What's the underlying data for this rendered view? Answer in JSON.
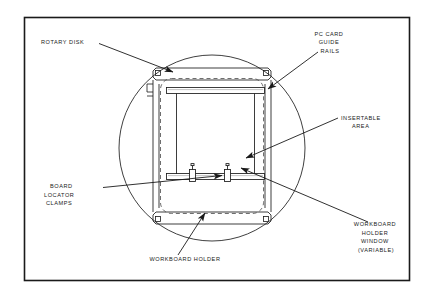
{
  "figure": {
    "type": "technical-line-diagram",
    "background_color": "#ffffff",
    "line_color": "#1a1a1a",
    "frame": {
      "x": 24,
      "y": 17,
      "width": 385,
      "height": 263
    }
  },
  "labels": {
    "rotary_disk": {
      "lines": [
        "ROTARY DISK"
      ],
      "align": "start",
      "x": 41,
      "y": 44
    },
    "pc_card_guide_rails": {
      "lines": [
        "PC CARD",
        "GUIDE",
        "RAILS"
      ],
      "align": "middle",
      "x": 330,
      "y": 36
    },
    "insertable_area": {
      "lines": [
        "INSERTABLE",
        "AREA"
      ],
      "align": "start",
      "x": 341,
      "y": 120
    },
    "board_locator_clamps": {
      "lines": [
        "BOARD",
        "LOCATOR",
        "CLAMPS"
      ],
      "align": "start",
      "x": 44,
      "y": 188
    },
    "workboard_holder": {
      "lines": [
        "WORKBOARD HOLDER"
      ],
      "align": "middle",
      "x": 185,
      "y": 261
    },
    "workboard_holder_window": {
      "lines": [
        "WORKBOARD",
        "HOLDER",
        "WINDOW",
        "(VARIABLE)"
      ],
      "align": "middle",
      "x": 376,
      "y": 226
    }
  },
  "parts": {
    "rotary_disk": {
      "shape": "circle",
      "cx": 212,
      "cy": 148,
      "r": 93
    },
    "holder_frame": {
      "shape": "rect",
      "x": 152,
      "y": 70,
      "width": 120,
      "height": 152
    },
    "holder_window": {
      "shape": "rounded-dashed-rect",
      "x": 158,
      "y": 76,
      "width": 108,
      "height": 140,
      "radius": 12
    },
    "top_guide_rail": {
      "shape": "bar",
      "x": 165,
      "y": 86,
      "width": 100,
      "height": 6
    },
    "bottom_guide_rail": {
      "shape": "bar",
      "x": 165,
      "y": 174,
      "width": 100,
      "height": 6
    },
    "left_side_rail": {
      "shape": "vertical-line",
      "x": 175,
      "y1": 92,
      "y2": 178
    },
    "right_side_rail": {
      "shape": "vertical-line",
      "x": 255,
      "y1": 92,
      "y2": 178
    },
    "board_locator_clamps": [
      {
        "x": 190,
        "y": 170,
        "width": 6,
        "height": 12
      },
      {
        "x": 225,
        "y": 170,
        "width": 6,
        "height": 12
      }
    ],
    "corner_brackets": 4
  }
}
